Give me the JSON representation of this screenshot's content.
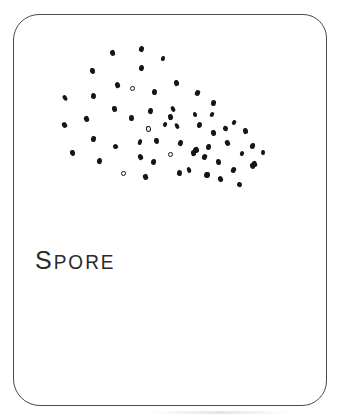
{
  "card": {
    "label": "SPORE",
    "background": "#ffffff",
    "border_color": "#4a4a4a",
    "ink_color": "#161616"
  },
  "illustration": {
    "name": "spore-dot-cluster",
    "dot_count": 59,
    "dots": [
      [
        112,
        53,
        5,
        6,
        -15,
        "s"
      ],
      [
        141,
        49,
        5,
        6,
        20,
        "s"
      ],
      [
        163,
        58,
        4,
        5,
        10,
        "s"
      ],
      [
        92,
        71,
        5,
        6,
        -10,
        "s"
      ],
      [
        141,
        68,
        5,
        6,
        15,
        "s"
      ],
      [
        117,
        85,
        5,
        6,
        -25,
        "s"
      ],
      [
        132,
        88,
        5,
        5,
        0,
        "o"
      ],
      [
        154,
        92,
        5,
        6,
        12,
        "s"
      ],
      [
        176,
        83,
        5,
        6,
        -18,
        "s"
      ],
      [
        65,
        98,
        4,
        6,
        -35,
        "s"
      ],
      [
        93,
        96,
        5,
        6,
        8,
        "s"
      ],
      [
        197,
        93,
        5,
        6,
        22,
        "s"
      ],
      [
        114,
        109,
        5,
        6,
        -12,
        "s"
      ],
      [
        150,
        111,
        5,
        6,
        18,
        "s"
      ],
      [
        173,
        109,
        4,
        6,
        -30,
        "s"
      ],
      [
        213,
        103,
        5,
        6,
        10,
        "s"
      ],
      [
        195,
        114,
        4,
        5,
        -8,
        "s"
      ],
      [
        212,
        114,
        4,
        5,
        25,
        "s"
      ],
      [
        86,
        119,
        5,
        6,
        -20,
        "s"
      ],
      [
        131,
        118,
        5,
        6,
        5,
        "s"
      ],
      [
        170,
        117,
        5,
        6,
        -15,
        "s"
      ],
      [
        234,
        122,
        4,
        5,
        30,
        "s"
      ],
      [
        64,
        125,
        5,
        6,
        -28,
        "s"
      ],
      [
        148,
        129,
        5,
        6,
        -10,
        "o"
      ],
      [
        165,
        124,
        4,
        5,
        15,
        "s"
      ],
      [
        177,
        126,
        4,
        6,
        -22,
        "s"
      ],
      [
        199,
        125,
        5,
        6,
        8,
        "s"
      ],
      [
        213,
        133,
        5,
        6,
        -12,
        "s"
      ],
      [
        225,
        128,
        5,
        5,
        20,
        "s"
      ],
      [
        245,
        131,
        5,
        6,
        -18,
        "s"
      ],
      [
        93,
        139,
        5,
        6,
        10,
        "s"
      ],
      [
        115,
        146,
        5,
        5,
        -25,
        "s"
      ],
      [
        140,
        142,
        4,
        6,
        15,
        "s"
      ],
      [
        156,
        141,
        5,
        6,
        -8,
        "s"
      ],
      [
        180,
        143,
        5,
        6,
        22,
        "s"
      ],
      [
        196,
        150,
        6,
        6,
        -15,
        "s"
      ],
      [
        208,
        147,
        5,
        6,
        5,
        "s"
      ],
      [
        227,
        143,
        5,
        6,
        -20,
        "s"
      ],
      [
        252,
        146,
        5,
        6,
        12,
        "s"
      ],
      [
        72,
        153,
        5,
        6,
        -10,
        "s"
      ],
      [
        99,
        161,
        5,
        6,
        18,
        "s"
      ],
      [
        140,
        157,
        5,
        6,
        -30,
        "s"
      ],
      [
        153,
        162,
        5,
        6,
        8,
        "s"
      ],
      [
        170,
        154,
        5,
        5,
        0,
        "o"
      ],
      [
        193,
        153,
        5,
        6,
        -15,
        "s"
      ],
      [
        204,
        157,
        5,
        6,
        25,
        "s"
      ],
      [
        218,
        162,
        5,
        6,
        -5,
        "s"
      ],
      [
        242,
        153,
        4,
        5,
        15,
        "s"
      ],
      [
        254,
        164,
        5,
        6,
        -22,
        "s"
      ],
      [
        263,
        152,
        4,
        5,
        10,
        "s"
      ],
      [
        123,
        173,
        5,
        5,
        0,
        "o"
      ],
      [
        145,
        177,
        5,
        6,
        -18,
        "s"
      ],
      [
        179,
        173,
        5,
        6,
        12,
        "s"
      ],
      [
        189,
        170,
        4,
        6,
        -25,
        "s"
      ],
      [
        207,
        175,
        6,
        6,
        8,
        "s"
      ],
      [
        220,
        179,
        5,
        6,
        -12,
        "s"
      ],
      [
        233,
        170,
        5,
        6,
        20,
        "s"
      ],
      [
        252,
        166,
        5,
        6,
        -8,
        "s"
      ],
      [
        239,
        184,
        5,
        5,
        15,
        "s"
      ]
    ]
  }
}
